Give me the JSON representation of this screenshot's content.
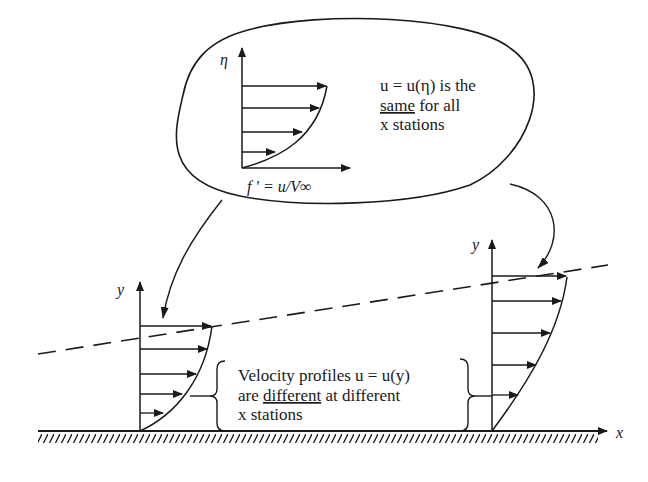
{
  "bubble": {
    "axis_y_label": "η",
    "axis_x_label": "f ′ = u/V∞",
    "text_line1": "u = u(η) is the",
    "text_line2_underlined": "same",
    "text_line2_rest": " for all",
    "text_line3": "x stations"
  },
  "left_profile": {
    "axis_y_label": "y"
  },
  "right_profile": {
    "axis_y_label": "y"
  },
  "wall": {
    "axis_x_label": "x"
  },
  "annotation": {
    "line1": "Velocity profiles u = u(y)",
    "line2_prefix": "are ",
    "line2_underlined": "different",
    "line2_suffix": " at different",
    "line3": "x stations"
  },
  "colors": {
    "ink": "#1a1a1a",
    "background": "#ffffff"
  }
}
